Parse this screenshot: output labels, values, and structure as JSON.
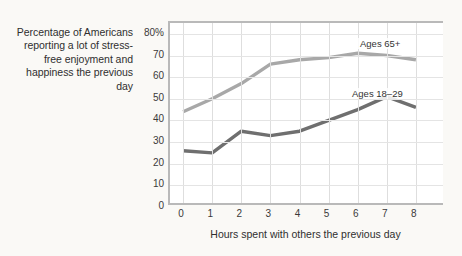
{
  "caption": "Percentage of Americans reporting a lot of stress-free enjoyment and happiness the previous day",
  "colors": {
    "series_old": "#a8a8a8",
    "series_young": "#6f6f6f",
    "gridline": "#dedede",
    "axis": "#b9b9b9",
    "background": "#faf9f6",
    "plot_background": "#ffffff",
    "text": "#2f2f2f"
  },
  "chart_data": {
    "type": "line",
    "title": "Percentage of Americans reporting a lot of stress-free enjoyment and happiness the previous day",
    "xlabel": "Hours spent with others the previous day",
    "ylabel": "",
    "x": [
      0,
      1,
      2,
      3,
      4,
      5,
      6,
      7,
      8
    ],
    "xticklabels": [
      "0",
      "1",
      "2",
      "3",
      "4",
      "5",
      "6",
      "7",
      "8"
    ],
    "yticks": [
      0,
      10,
      20,
      30,
      40,
      50,
      60,
      70,
      80
    ],
    "yticklabels": [
      "0",
      "10",
      "20",
      "30",
      "40",
      "50",
      "60",
      "70",
      "80%"
    ],
    "xlim": [
      -0.45,
      9.0
    ],
    "ylim": [
      0,
      85
    ],
    "grid": true,
    "legend_position": "inline-annotation",
    "series": [
      {
        "name": "Ages 65+",
        "color": "#a8a8a8",
        "values": [
          44,
          50,
          57,
          66,
          68,
          69,
          71,
          70,
          68
        ]
      },
      {
        "name": "Ages 18–29",
        "color": "#6f6f6f",
        "values": [
          26,
          25,
          35,
          33,
          35,
          40,
          45,
          51,
          46
        ]
      }
    ],
    "annotations": [
      {
        "text": "Ages 65+",
        "x": 6,
        "y": 76
      },
      {
        "text": "Ages 18–29",
        "x": 6,
        "y": 54
      }
    ]
  }
}
